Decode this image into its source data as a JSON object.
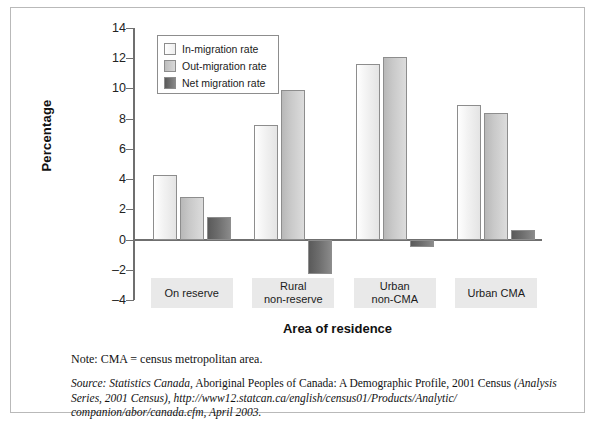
{
  "chart_data": {
    "type": "bar",
    "title": "",
    "xlabel": "Area of residence",
    "ylabel": "Percentage",
    "ylim": [
      -4,
      14
    ],
    "yticks": [
      14,
      12,
      10,
      8,
      6,
      4,
      2,
      0,
      -2,
      -4
    ],
    "ytick_labels": [
      "14",
      "12",
      "10",
      "8",
      "6",
      "4",
      "2",
      "0",
      "–2",
      "–4"
    ],
    "grid": false,
    "legend_position": "upper-left-inside",
    "categories": [
      "On reserve",
      "Rural non-reserve",
      "Urban non-CMA",
      "Urban CMA"
    ],
    "category_lines": [
      [
        "On reserve"
      ],
      [
        "Rural",
        "non-reserve"
      ],
      [
        "Urban",
        "non-CMA"
      ],
      [
        "Urban CMA"
      ]
    ],
    "series": [
      {
        "name": "In-migration rate",
        "color": "#f4f4f4",
        "values": [
          4.3,
          7.6,
          11.6,
          8.9
        ]
      },
      {
        "name": "Out-migration rate",
        "color": "#c9c9c9",
        "values": [
          2.8,
          9.9,
          12.1,
          8.4
        ]
      },
      {
        "name": "Net migration rate",
        "color": "#6d6d6d",
        "values": [
          1.5,
          -2.3,
          -0.5,
          0.6
        ]
      }
    ]
  },
  "notes": {
    "note": "Note: CMA = census metropolitan area.",
    "source_label": "Source:",
    "source_italic_1": "Statistics Canada,",
    "source_plain_1": " Aboriginal Peoples of Canada: A Demographic Profile, 2001 Census",
    "source_italic_2": "(Analysis Series, 2001 Census), http://www12.statcan.ca/english/census01/Products/Analytic/ companion/abor/canada.cfm, April 2003."
  }
}
